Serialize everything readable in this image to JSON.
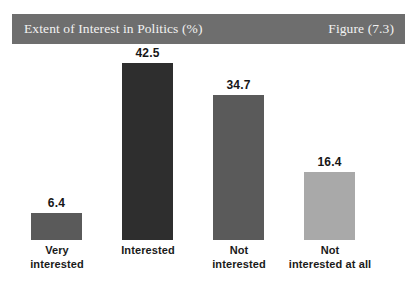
{
  "header": {
    "title": "Extent of Interest in Politics (%)",
    "figure_label": "Figure (7.3)",
    "bar_color": "#6e6e6e",
    "text_color": "#f2f2f2"
  },
  "chart_data": {
    "type": "bar",
    "title": "Extent of Interest in Politics (%)",
    "subtitle": "Figure (7.3)",
    "xlabel": "",
    "ylabel": "",
    "ylim": [
      0,
      46
    ],
    "grid": false,
    "legend": "none",
    "background": "#ffffff",
    "categories": [
      "Very interested",
      "Interested",
      "Not interested",
      "Not interested at all"
    ],
    "category_lines": [
      [
        "Very",
        "interested"
      ],
      [
        "Interested"
      ],
      [
        "Not",
        "interested"
      ],
      [
        "Not",
        "interested at all"
      ]
    ],
    "values": [
      6.4,
      42.5,
      34.7,
      16.4
    ],
    "value_labels": [
      "6.4",
      "42.5",
      "34.7",
      "16.4"
    ],
    "bar_colors": [
      "#5a5a5a",
      "#2e2e2e",
      "#5a5a5a",
      "#a9a9a9"
    ]
  }
}
